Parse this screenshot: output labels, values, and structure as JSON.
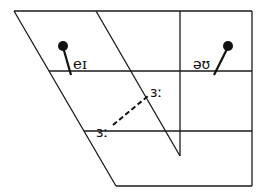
{
  "diagram": {
    "type": "IPA vowel quadrilateral",
    "colors": {
      "line": "#1a1a1a",
      "marker": "#111111",
      "background": "#ffffff"
    },
    "vowels": [
      {
        "symbol": "eɪ",
        "type": "diphthong",
        "marker": "dot-with-tail"
      },
      {
        "symbol": "əʊ",
        "type": "diphthong",
        "marker": "dot-with-tail"
      },
      {
        "symbol": "ɜː",
        "type": "monophthong",
        "position": "upper"
      },
      {
        "symbol": "ɜː",
        "type": "monophthong",
        "position": "lower"
      }
    ],
    "connector": {
      "style": "dashed",
      "from": "ɜː (lower)",
      "to": "ɜː (upper)"
    }
  }
}
